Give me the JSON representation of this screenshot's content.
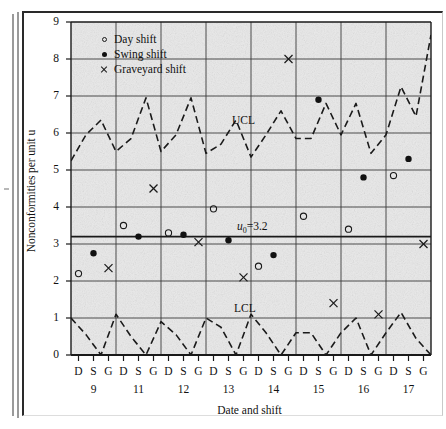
{
  "chart_data": {
    "type": "scatter",
    "title": "",
    "xlabel": "Date and shift",
    "ylabel": "Nonconformities per unit u",
    "ylim": [
      0,
      9
    ],
    "yticks": [
      0,
      1,
      2,
      3,
      4,
      5,
      6,
      7,
      8,
      9
    ],
    "grid": true,
    "legend_position": "top-left",
    "dates": [
      "9",
      "11",
      "12",
      "13",
      "14",
      "15",
      "16",
      "17"
    ],
    "shifts": [
      "D",
      "S",
      "G"
    ],
    "xtick_labels": [
      "D",
      "S",
      "G",
      "D",
      "S",
      "G",
      "D",
      "S",
      "G",
      "D",
      "S",
      "G",
      "D",
      "S",
      "G",
      "D",
      "S",
      "G",
      "D",
      "S",
      "G",
      "D",
      "S",
      "G"
    ],
    "legend": [
      {
        "label": "Day shift",
        "marker": "open-circle"
      },
      {
        "label": "Swing shift",
        "marker": "filled-circle"
      },
      {
        "label": "Graveyard shift",
        "marker": "cross"
      }
    ],
    "control_limits": [
      {
        "name": "UCL",
        "label": "UCL",
        "type": "variable",
        "nominal": 6.0
      },
      {
        "name": "center",
        "label": "u0=3.2",
        "label_base": "u",
        "label_sub": "0",
        "label_rest": "=3.2",
        "value": 3.2,
        "type": "constant"
      },
      {
        "name": "LCL",
        "label": "LCL",
        "type": "variable",
        "nominal": 0.6
      }
    ],
    "ucl_values": [
      5.25,
      5.95,
      6.35,
      5.5,
      5.85,
      6.95,
      5.5,
      5.95,
      6.95,
      5.45,
      5.7,
      6.35,
      5.35,
      5.95,
      6.6,
      5.85,
      5.85,
      6.8,
      5.95,
      6.8,
      5.45,
      5.95,
      7.25,
      6.45,
      8.65
    ],
    "lcl_values": [
      1.0,
      0.55,
      0.0,
      1.1,
      0.5,
      0.0,
      0.9,
      0.55,
      0.0,
      1.0,
      0.75,
      0.0,
      1.1,
      0.6,
      0.0,
      0.6,
      0.6,
      0.0,
      0.6,
      1.0,
      0.0,
      0.6,
      1.15,
      0.45,
      0.0
    ],
    "series": [
      {
        "name": "Day shift",
        "marker": "open-circle",
        "points": [
          {
            "date": "9",
            "shift": "D",
            "index": 0,
            "value": 2.2
          },
          {
            "date": "11",
            "shift": "D",
            "index": 3,
            "value": 3.5
          },
          {
            "date": "12",
            "shift": "D",
            "index": 6,
            "value": 3.3
          },
          {
            "date": "13",
            "shift": "D",
            "index": 9,
            "value": 3.95
          },
          {
            "date": "14",
            "shift": "D",
            "index": 12,
            "value": 2.4
          },
          {
            "date": "15",
            "shift": "D",
            "index": 15,
            "value": 3.75
          },
          {
            "date": "16",
            "shift": "D",
            "index": 18,
            "value": 3.4
          },
          {
            "date": "17",
            "shift": "D",
            "index": 21,
            "value": 4.85
          }
        ]
      },
      {
        "name": "Swing shift",
        "marker": "filled-circle",
        "points": [
          {
            "date": "9",
            "shift": "S",
            "index": 1,
            "value": 2.75
          },
          {
            "date": "11",
            "shift": "S",
            "index": 4,
            "value": 3.2
          },
          {
            "date": "12",
            "shift": "S",
            "index": 7,
            "value": 3.25
          },
          {
            "date": "13",
            "shift": "S",
            "index": 10,
            "value": 3.1
          },
          {
            "date": "14",
            "shift": "S",
            "index": 13,
            "value": 2.7
          },
          {
            "date": "15",
            "shift": "S",
            "index": 16,
            "value": 6.9
          },
          {
            "date": "16",
            "shift": "S",
            "index": 19,
            "value": 4.8
          },
          {
            "date": "17",
            "shift": "S",
            "index": 22,
            "value": 5.3
          }
        ]
      },
      {
        "name": "Graveyard shift",
        "marker": "cross",
        "points": [
          {
            "date": "9",
            "shift": "G",
            "index": 2,
            "value": 2.35
          },
          {
            "date": "11",
            "shift": "G",
            "index": 5,
            "value": 4.5
          },
          {
            "date": "12",
            "shift": "G",
            "index": 8,
            "value": 3.05
          },
          {
            "date": "13",
            "shift": "G",
            "index": 11,
            "value": 2.1
          },
          {
            "date": "14",
            "shift": "G",
            "index": 14,
            "value": 8.0
          },
          {
            "date": "15",
            "shift": "G",
            "index": 17,
            "value": 1.4
          },
          {
            "date": "16",
            "shift": "G",
            "index": 20,
            "value": 1.1
          },
          {
            "date": "17",
            "shift": "G",
            "index": 23,
            "value": 3.0
          }
        ]
      }
    ]
  }
}
